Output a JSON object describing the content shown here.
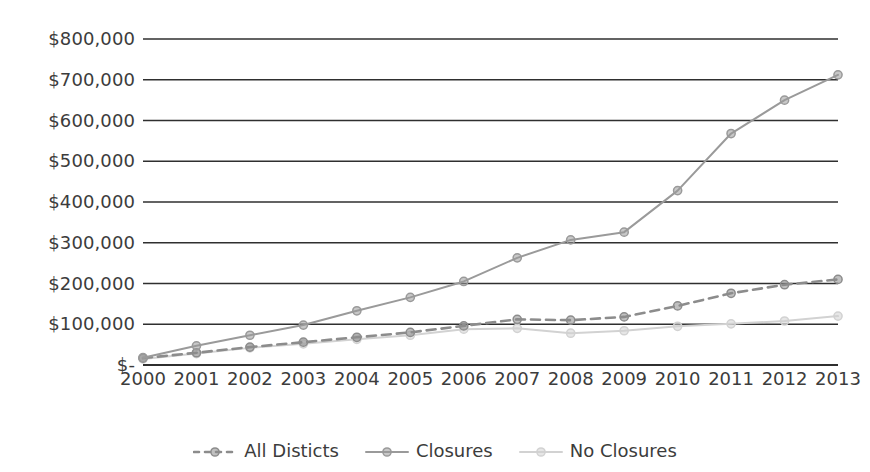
{
  "chart_data": {
    "type": "line",
    "title": "",
    "subtitle": "",
    "xlabel": "",
    "ylabel": "",
    "categories": [
      "2000",
      "2001",
      "2002",
      "2003",
      "2004",
      "2005",
      "2006",
      "2007",
      "2008",
      "2009",
      "2010",
      "2011",
      "2012",
      "2013"
    ],
    "x": [
      2000,
      2001,
      2002,
      2003,
      2004,
      2005,
      2006,
      2007,
      2008,
      2009,
      2010,
      2011,
      2012,
      2013
    ],
    "ylim": [
      0,
      800000
    ],
    "xlim": [
      2000,
      2013
    ],
    "ytick_values": [
      0,
      100000,
      200000,
      300000,
      400000,
      500000,
      600000,
      700000,
      800000
    ],
    "ytick_labels": [
      "$-",
      "$100,000",
      "$200,000",
      "$300,000",
      "$400,000",
      "$500,000",
      "$600,000",
      "$700,000",
      "$800,000"
    ],
    "grid": true,
    "grid_axis": "y",
    "legend_position": "bottom",
    "series": [
      {
        "name": "All Disticts",
        "color": "#8c8c8c",
        "style": "dashed",
        "marker": "circle",
        "values": [
          17000,
          30000,
          44000,
          56000,
          68000,
          80000,
          96000,
          112000,
          110000,
          118000,
          145000,
          176000,
          197000,
          210000
        ]
      },
      {
        "name": "Closures",
        "color": "#9a9a9a",
        "style": "solid",
        "marker": "circle",
        "values": [
          18000,
          47000,
          73000,
          98000,
          133000,
          166000,
          205000,
          263000,
          307000,
          326000,
          428000,
          568000,
          650000,
          712000
        ]
      },
      {
        "name": "No Closures",
        "color": "#d2d2d2",
        "style": "solid",
        "marker": "circle",
        "values": [
          15000,
          28000,
          42000,
          52000,
          63000,
          73000,
          88000,
          90000,
          78000,
          84000,
          95000,
          101000,
          108000,
          120000
        ]
      }
    ]
  },
  "legend": {
    "items": [
      {
        "label": "All Disticts",
        "marker_name": "legend-marker-all-disticts"
      },
      {
        "label": "Closures",
        "marker_name": "legend-marker-closures"
      },
      {
        "label": "No Closures",
        "marker_name": "legend-marker-no-closures"
      }
    ]
  },
  "colors": {
    "axis": "#3a3a3a",
    "gridline": "#2f2f2f",
    "series_all_disticts": "#8c8c8c",
    "series_closures": "#9a9a9a",
    "series_no_closures": "#d2d2d2",
    "text": "#3c3c3c",
    "background": "#ffffff"
  }
}
